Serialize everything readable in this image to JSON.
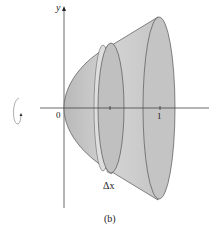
{
  "figure": {
    "caption": "(b)",
    "axes": {
      "y_label": "y",
      "x_label": "x",
      "origin_label": "0",
      "x_tick_label": "1"
    },
    "slice_label": "Δx",
    "rotation_indicator": "rotation-arrow-about-x-axis",
    "colors": {
      "solid_fill": "#cfcfcf",
      "solid_shade": "#b8b8b8",
      "slice_fill": "#dcdcdc",
      "outline": "#555555",
      "axis": "#444444"
    }
  }
}
